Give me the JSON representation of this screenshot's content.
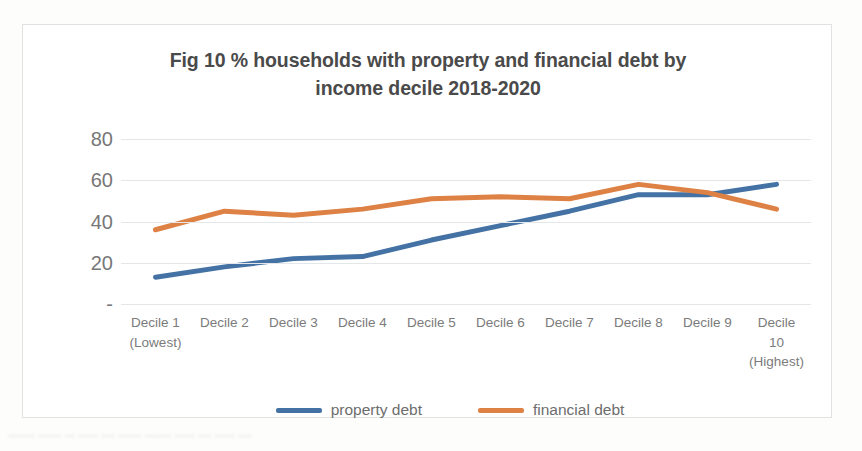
{
  "chart_data": {
    "type": "line",
    "title": "Fig 10 % households with property and financial debt by income decile 2018-2020",
    "title_line_1": "Fig 10 % households with property and financial debt by",
    "title_line_2": "income decile 2018-2020",
    "xlabel": "",
    "ylabel": "",
    "ylim": [
      0,
      80
    ],
    "y_ticks": [
      "-",
      "20",
      "40",
      "60",
      "80"
    ],
    "y_tick_values": [
      0,
      20,
      40,
      60,
      80
    ],
    "grid": true,
    "legend_position": "bottom",
    "categories": [
      "Decile 1 (Lowest)",
      "Decile 2",
      "Decile 3",
      "Decile 4",
      "Decile 5",
      "Decile 6",
      "Decile 7",
      "Decile 8",
      "Decile 9",
      "Decile 10 (Highest)"
    ],
    "category_lines": [
      [
        "Decile 1",
        "(Lowest)"
      ],
      [
        "Decile 2"
      ],
      [
        "Decile 3"
      ],
      [
        "Decile 4"
      ],
      [
        "Decile 5"
      ],
      [
        "Decile 6"
      ],
      [
        "Decile 7"
      ],
      [
        "Decile 8"
      ],
      [
        "Decile 9"
      ],
      [
        "Decile",
        "10",
        "(Highest)"
      ]
    ],
    "series": [
      {
        "name": "property debt",
        "color": "#4472A4",
        "values": [
          13,
          18,
          22,
          23,
          31,
          38,
          45,
          53,
          53,
          58
        ]
      },
      {
        "name": "financial debt",
        "color": "#DD8145",
        "values": [
          36,
          45,
          43,
          46,
          51,
          52,
          51,
          58,
          54,
          46
        ]
      }
    ]
  },
  "legend": {
    "items": [
      {
        "label": "property debt",
        "color": "#4472A4"
      },
      {
        "label": "financial debt",
        "color": "#DD8145"
      }
    ]
  },
  "scan_artifact": {
    "text": "........ ....... ... ...... .... ....... ........ ...... .... ...... ...."
  }
}
